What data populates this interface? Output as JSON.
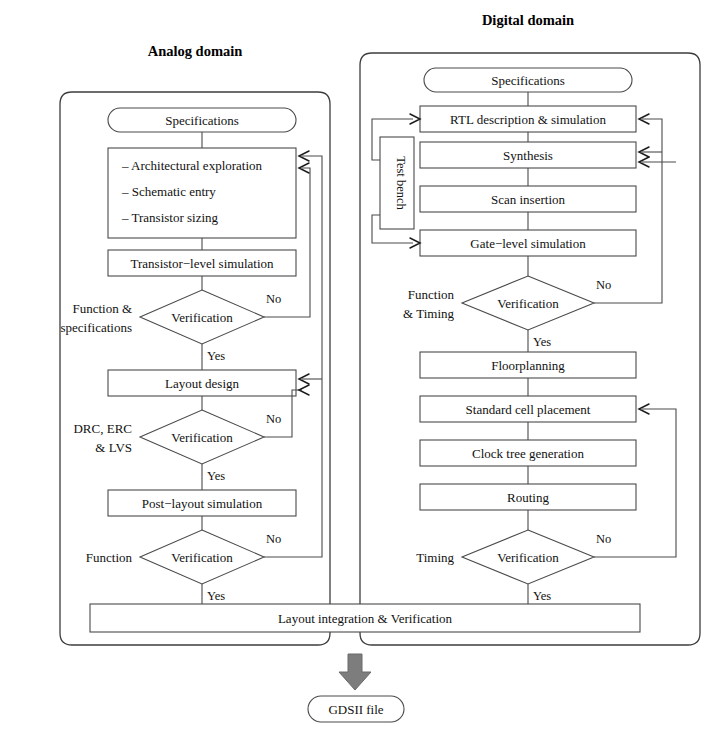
{
  "figure": {
    "type": "flowchart"
  },
  "titles": {
    "analog": "Analog domain",
    "digital": "Digital domain"
  },
  "analog": {
    "spec": "Specifications",
    "tasks": {
      "line1": "– Architectural exploration",
      "line2": "– Schematic entry",
      "line3": "– Transistor sizing"
    },
    "sim1": "Transistor−level simulation",
    "verify1": {
      "label": "Verification",
      "side": "Function &",
      "side2": "specifications",
      "no": "No",
      "yes": "Yes"
    },
    "layout": "Layout design",
    "verify2": {
      "label": "Verification",
      "side": "DRC, ERC",
      "side2": "& LVS",
      "no": "No",
      "yes": "Yes"
    },
    "sim2": "Post−layout simulation",
    "verify3": {
      "label": "Verification",
      "side": "Function",
      "no": "No",
      "yes": "Yes"
    }
  },
  "digital": {
    "spec": "Specifications",
    "rtl": "RTL description & simulation",
    "synthesis": "Synthesis",
    "scan": "Scan insertion",
    "gate": "Gate−level simulation",
    "testbench": "Test bench",
    "verify1": {
      "label": "Verification",
      "side": "Function",
      "side2": "& Timing",
      "no": "No",
      "yes": "Yes"
    },
    "floorplan": "Floorplanning",
    "placement": "Standard cell placement",
    "clocktree": "Clock tree generation",
    "routing": "Routing",
    "verify2": {
      "label": "Verification",
      "side": "Timing",
      "no": "No",
      "yes": "Yes"
    }
  },
  "shared": {
    "integration": "Layout integration & Verification",
    "gdsii": "GDSII file"
  },
  "colors": {
    "stroke": "#4a4a4a",
    "text": "#111111",
    "arrow_fill": "#7d7d7d",
    "background": "#ffffff"
  }
}
